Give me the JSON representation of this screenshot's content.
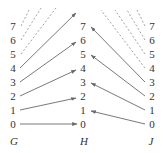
{
  "diagram": {
    "columns": [
      {
        "id": "G",
        "title": "G",
        "x": 13,
        "labels": [
          "0",
          "1",
          "2",
          "3",
          "4",
          "5",
          "6",
          "7"
        ]
      },
      {
        "id": "H",
        "title": "H",
        "x": 83,
        "labels": [
          "0",
          "1",
          "2",
          "3",
          "4",
          "5",
          "6",
          "7"
        ]
      },
      {
        "id": "J",
        "title": "J",
        "x": 152,
        "labels": [
          "0",
          "1",
          "2",
          "3",
          "4",
          "5",
          "6",
          "7"
        ]
      }
    ],
    "row_y": [
      124,
      110,
      96,
      82,
      68,
      54,
      40,
      26
    ],
    "title_y": 141,
    "arrows_G_to_H": [
      {
        "from": 0,
        "to": 0
      },
      {
        "from": 1,
        "to": 2
      },
      {
        "from": 2,
        "to": 4
      },
      {
        "from": 3,
        "to": 6
      },
      {
        "from": 4,
        "to": "8 (offscreen)"
      }
    ],
    "dashed_G": [
      5,
      6,
      7
    ],
    "arrows_J_to_H": [
      {
        "from": 0,
        "to": 1
      },
      {
        "from": 1,
        "to": 3
      },
      {
        "from": 2,
        "to": 5
      },
      {
        "from": 3,
        "to": 7
      }
    ],
    "dashed_J": [
      4,
      5,
      6,
      7
    ],
    "colors": {
      "text": "#333333",
      "arrow": "#6a6a6a",
      "dashed": "#8a8a8a"
    }
  }
}
